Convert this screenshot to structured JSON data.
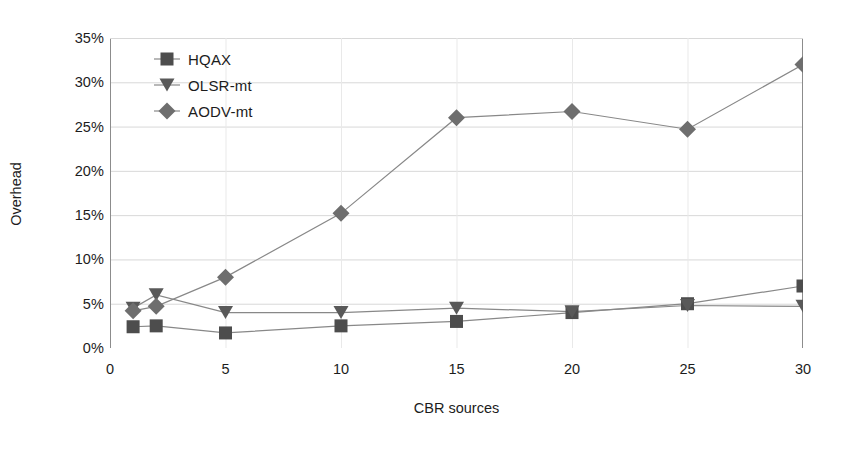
{
  "chart_data": {
    "type": "line",
    "title": "",
    "xlabel": "CBR sources",
    "ylabel": "Overhead",
    "xlim": [
      0,
      30
    ],
    "ylim": [
      0,
      0.35
    ],
    "xticks": [
      "0",
      "5",
      "10",
      "15",
      "20",
      "25",
      "30"
    ],
    "xtick_values": [
      0,
      5,
      10,
      15,
      20,
      25,
      30
    ],
    "yticks": [
      "0%",
      "5%",
      "10%",
      "15%",
      "20%",
      "25%",
      "30%",
      "35%"
    ],
    "ytick_values": [
      0,
      5,
      10,
      15,
      20,
      25,
      30,
      35
    ],
    "grid": true,
    "grid_axis": "y",
    "legend_position": "upper-left-inside",
    "x": [
      1,
      2,
      5,
      10,
      15,
      20,
      25,
      30
    ],
    "series": [
      {
        "name": "HQAX",
        "marker": "square",
        "color": "#4d4d4d",
        "values": [
          2.4,
          2.5,
          1.7,
          2.5,
          3.0,
          4.0,
          5.0,
          7.0
        ]
      },
      {
        "name": "OLSR-mt",
        "marker": "triangle-down",
        "color": "#595959",
        "values": [
          4.5,
          6.0,
          4.0,
          4.0,
          4.5,
          4.1,
          4.8,
          4.7
        ]
      },
      {
        "name": "AODV-mt",
        "marker": "diamond",
        "color": "#6e6e6e",
        "values": [
          4.2,
          4.7,
          8.0,
          15.2,
          26.0,
          26.7,
          24.7,
          32.0
        ]
      }
    ]
  },
  "legend": {
    "items": [
      {
        "label": "HQAX"
      },
      {
        "label": "OLSR-mt"
      },
      {
        "label": "AODV-mt"
      }
    ]
  },
  "axes": {
    "x_title": "CBR sources",
    "y_title": "Overhead"
  },
  "colors": {
    "axis": "#8c8c8c",
    "grid": "#d8d8d8",
    "line": "#888888",
    "text": "#1c1c1c"
  }
}
